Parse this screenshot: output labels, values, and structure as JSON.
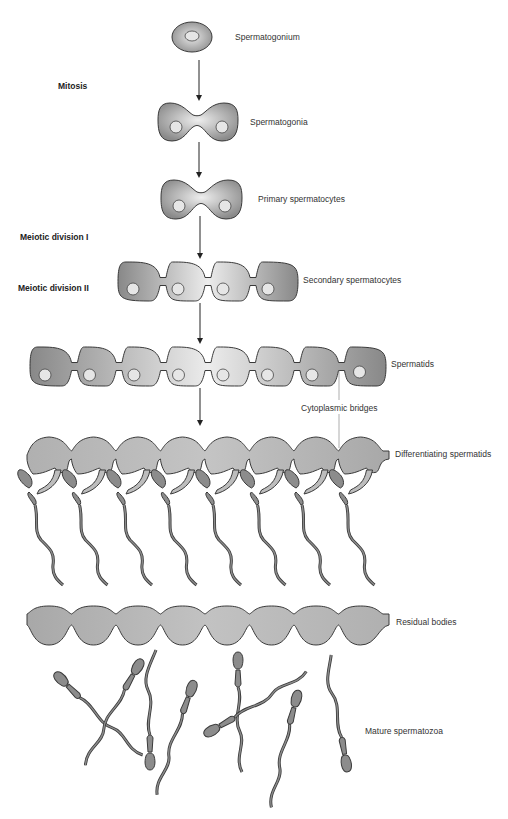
{
  "stages": {
    "mitosis": "Mitosis",
    "meiotic_1": "Meiotic division I",
    "meiotic_2": "Meiotic division II"
  },
  "labels": {
    "spermatogonium": "Spermatogonium",
    "spermatogonia": "Spermatogonia",
    "primary": "Primary spermatocytes",
    "secondary": "Secondary spermatocytes",
    "spermatids": "Spermatids",
    "bridges": "Cytoplasmic bridges",
    "differentiating": "Differentiating spermatids",
    "residual": "Residual bodies",
    "mature": "Mature spermatozoa"
  },
  "cell_counts": {
    "spermatogonium": 1,
    "spermatogonia": 2,
    "primary": 2,
    "secondary": 4,
    "spermatids": 8,
    "differentiating": 8,
    "residual": 8,
    "mature": 8
  },
  "colors": {
    "cell_dark": "#8a8a8a",
    "cell_light": "#e8e8e8",
    "nucleus": "#e6e6e6",
    "diff_fill": "#bdbdbd",
    "residual_fill": "#b5b5b5",
    "sperm_fill": "#8c8c8c",
    "outline": "#3a3a3a"
  }
}
